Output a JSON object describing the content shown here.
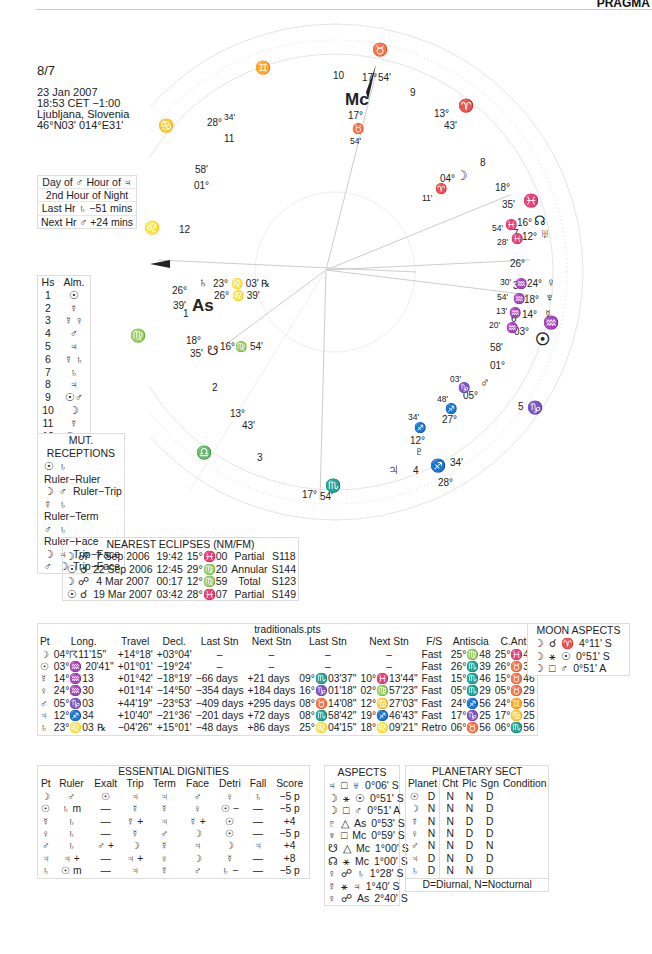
{
  "header": {
    "brand": "PRAGMA"
  },
  "chart": {
    "name": "8/7",
    "date": "23 Jan 2007",
    "time": "18:53  CET −1:00",
    "place": "Ljubljana, Slovenia",
    "coords": "46°N03' 014°E31'"
  },
  "planetary_hours": [
    "Day of ♂  Hour of ♃",
    "2nd Hour of Night",
    "Last Hr ♄  −51 mins",
    "Next Hr ♂  +24 mins"
  ],
  "almuten": {
    "headers": [
      "Hs",
      "Alm."
    ],
    "rows": [
      [
        "1",
        "☉"
      ],
      [
        "2",
        "☿"
      ],
      [
        "3",
        "☿ ♀"
      ],
      [
        "4",
        "♂"
      ],
      [
        "5",
        "♃"
      ],
      [
        "6",
        "☿ ♄"
      ],
      [
        "7",
        "♄"
      ],
      [
        "8",
        "♃"
      ],
      [
        "9",
        "☉♂"
      ],
      [
        "10",
        "☽"
      ],
      [
        "11",
        "☿"
      ],
      [
        "12",
        "☉♃"
      ]
    ]
  },
  "mutual_receptions": {
    "title": "MUT. RECEPTIONS",
    "rows": [
      [
        "☉",
        "♄",
        "Ruler−Ruler"
      ],
      [
        "☽",
        "♂",
        "Ruler−Trip"
      ],
      [
        "☿",
        "♄",
        "Ruler−Term"
      ],
      [
        "♂",
        "♄",
        "Ruler−Face"
      ],
      [
        "☽",
        "♃",
        "Trip−Face"
      ],
      [
        "♂",
        "☽",
        "Trip−Face"
      ]
    ]
  },
  "eclipses": {
    "title": "NEAREST ECLIPSES (NM/FM)",
    "rows": [
      [
        "☽ ☍",
        "7 Sep 2006",
        "19:42",
        "15°♓00",
        "Partial",
        "S118"
      ],
      [
        "☉ ☌",
        "22 Sep 2006",
        "12:45",
        "29°♍20",
        "Annular",
        "S144"
      ],
      [
        "☽ ☍",
        "4 Mar 2007",
        "00:17",
        "12°♍59",
        "Total",
        "S123"
      ],
      [
        "☉ ☌",
        "19 Mar 2007",
        "03:42",
        "28°♓07",
        "Partial",
        "S149"
      ]
    ]
  },
  "traditionals": {
    "title": "traditionals.pts",
    "headers": [
      "Pt",
      "Long.",
      "Travel",
      "Decl.",
      "Last Stn",
      "Next Stn",
      "Last Stn",
      "Next Stn",
      "F/S",
      "Antiscia",
      "C.Ant."
    ],
    "rows": [
      [
        "☽",
        "04°☈11'15\"",
        "+14°18'",
        "+03°04'",
        "–",
        "–",
        "–",
        "–",
        "Fast",
        "25°♍48",
        "25°♓48"
      ],
      [
        "☉",
        "03°♒ 20'41\"",
        "+01°01'",
        "−19°24'",
        "–",
        "–",
        "–",
        "–",
        "Fast",
        "26°♏39",
        "26°♉39"
      ],
      [
        "☿",
        "14°♒13",
        "+01°42'",
        "−18°19'",
        "−66 days",
        "+21 days",
        "09°♏03'37\"",
        "10°♓13'44\"",
        "Fast",
        "15°♏46",
        "15°♉46"
      ],
      [
        "♀",
        "24°♒30",
        "+01°14'",
        "−14°50'",
        "−354 days",
        "+184 days",
        "16°♑01'18\"",
        "02°♍57'23\"",
        "Fast",
        "05°♏29",
        "05°♉29"
      ],
      [
        "♂",
        "05°♑03",
        "+44'19\"",
        "−23°53'",
        "−409 days",
        "+295 days",
        "08°♉14'08\"",
        "12°♋27'03\"",
        "Fast",
        "24°♐56",
        "24°♊56"
      ],
      [
        "♃",
        "12°♐34",
        "+10'40\"",
        "−21°36'",
        "−201 days",
        "+72 days",
        "08°♏58'42\"",
        "19°♐46'43\"",
        "Fast",
        "17°♑25",
        "17°♋25"
      ],
      [
        "♄",
        "23°♌03 ℞",
        "−04'26\"",
        "+15°01'",
        "−48 days",
        "+86 days",
        "25°♌04'15\"",
        "18°♌09'21\"",
        "Retro",
        "06°♉56",
        "06°♏56"
      ]
    ]
  },
  "moon_aspects": {
    "title": "MOON ASPECTS",
    "rows": [
      [
        "☽",
        "☌",
        "♈",
        "4°11' S"
      ],
      [
        "☽",
        "⚹",
        "☉",
        "0°51' S"
      ],
      [
        "☽",
        "□",
        "♂",
        "0°51' A"
      ]
    ]
  },
  "dignities": {
    "title": "ESSENTIAL DIGNITIES",
    "headers": [
      "Pt",
      "Ruler",
      "Exalt",
      "Trip",
      "Term",
      "Face",
      "Detri",
      "Fall",
      "Score"
    ],
    "rows": [
      [
        "☽",
        "♂",
        "☉",
        "♃",
        "♃",
        "♂",
        "♀",
        "♄",
        "−5 p"
      ],
      [
        "☉",
        "♄ m",
        "—",
        "☿",
        "☿",
        "♀",
        "☉ −",
        "—",
        "−5 p"
      ],
      [
        "☿",
        "♄",
        "—",
        "☿ +",
        "♃",
        "☿ +",
        "☉",
        "—",
        "+4"
      ],
      [
        "♀",
        "♄",
        "—",
        "☿",
        "♂",
        "☽",
        "☉",
        "—",
        "−5 p"
      ],
      [
        "♂",
        "♄",
        "♂ +",
        "☽",
        "☿",
        "♃",
        "☽",
        "♃",
        "+4"
      ],
      [
        "♃",
        "♃ +",
        "—",
        "♃ +",
        "♀",
        "☽",
        "☿",
        "—",
        "+8"
      ],
      [
        "♄",
        "☉ m",
        "—",
        "♃",
        "☿",
        "♂",
        "♄ −",
        "—",
        "−5 p"
      ]
    ]
  },
  "aspects": {
    "title": "ASPECTS",
    "rows": [
      [
        "♃",
        "□",
        "♅",
        "0°06' S"
      ],
      [
        "☽",
        "⚹",
        "☉",
        "0°51' S"
      ],
      [
        "☽",
        "□",
        "♂",
        "0°51' A"
      ],
      [
        "♇",
        "△",
        "As",
        "0°53' S"
      ],
      [
        "♆",
        "□",
        "Mc",
        "0°59' S"
      ],
      [
        "☋",
        "△",
        "Mc",
        "1°00' S"
      ],
      [
        "☊",
        "⚹",
        "Mc",
        "1°00' S"
      ],
      [
        "♀",
        "☍",
        "♄",
        "1°28' S"
      ],
      [
        "☿",
        "⚹",
        "♃",
        "1°40' S"
      ],
      [
        "♀",
        "☍",
        "As",
        "2°40' S"
      ]
    ]
  },
  "sect": {
    "title": "PLANETARY SECT",
    "headers": [
      "Planet",
      "Cht",
      "Plc",
      "Sgn",
      "Condition"
    ],
    "rows": [
      [
        "☉",
        "D",
        "N",
        "N",
        "D",
        ""
      ],
      [
        "☽",
        "N",
        "N",
        "N",
        "D",
        ""
      ],
      [
        "☿",
        "N",
        "N",
        "D",
        "D",
        ""
      ],
      [
        "♀",
        "N",
        "N",
        "D",
        "D",
        ""
      ],
      [
        "♂",
        "N",
        "N",
        "D",
        "N",
        ""
      ],
      [
        "♃",
        "D",
        "N",
        "D",
        "D",
        ""
      ],
      [
        "♄",
        "D",
        "N",
        "N",
        "D",
        ""
      ]
    ],
    "legend": "D=Diurnal, N=Nocturnal"
  },
  "wheel": {
    "cusps": {
      "mc": {
        "label": "Mc",
        "deg": "17°",
        "sign": "♉",
        "min": "54'"
      },
      "asc": {
        "label": "As",
        "deg": "26°",
        "min": "39'"
      },
      "desc": {
        "deg": "26°",
        "min": "39'"
      },
      "ic": {
        "deg": "17°",
        "min": "54'"
      },
      "c11": {
        "deg": "28°",
        "min": "34'"
      },
      "c12": {
        "deg": "01°",
        "min": "58'"
      },
      "c2": {
        "deg": "18°",
        "min": "35'"
      },
      "c3": {
        "deg": "13°",
        "min": "43'"
      },
      "c8": {
        "deg": "13°",
        "min": "43'"
      },
      "c7": {
        "deg": "18°",
        "min": "35'"
      },
      "c5": {
        "deg": "28°",
        "min": "34'"
      },
      "c6": {
        "deg": "01°",
        "min": "58'"
      }
    },
    "house_numbers": [
      "1",
      "2",
      "3",
      "4",
      "5",
      "6",
      "7",
      "8",
      "9",
      "10",
      "11",
      "12"
    ],
    "signs": {
      "taurus": "♉",
      "gemini": "♊",
      "cancer": "♋",
      "leo": "♌",
      "virgo": "♍",
      "libra": "♎",
      "scorpio": "♏",
      "sagittarius": "♐",
      "capricorn": "♑",
      "aquarius": "♒",
      "pisces": "♓",
      "aries": "♈"
    },
    "planets": {
      "saturn": {
        "glyph": "♄",
        "text": "23° ♌ 03' ℞"
      },
      "asc_text": "26° ♌ 39'",
      "south_node": {
        "glyph": "☋",
        "text": "16°♍ 54'"
      },
      "moon": {
        "glyph": "☽",
        "deg": "04°",
        "sign": "♈",
        "min": "11'"
      },
      "north_node": {
        "glyph": "☊",
        "deg": "16°",
        "sign": "♓",
        "min": "54'"
      },
      "uranus": {
        "glyph": "♅",
        "deg": "12°",
        "sign": "♓",
        "min": "28'"
      },
      "venus": {
        "glyph": "♀",
        "deg": "24°",
        "sign": "♒",
        "min": "30'"
      },
      "neptune": {
        "glyph": "♆",
        "deg": "18°",
        "sign": "♒",
        "min": "54'"
      },
      "mercury": {
        "glyph": "☿",
        "deg": "14°",
        "sign": "♒",
        "min": "13'"
      },
      "sun": {
        "glyph": "☉",
        "deg": "03°",
        "sign": "♒",
        "min": "20'"
      },
      "mars": {
        "glyph": "♂",
        "deg": "05°",
        "sign": "♑",
        "min": "03'"
      },
      "pluto": {
        "glyph": "♇",
        "deg": "27°",
        "sign": "♐",
        "min": "48'"
      },
      "jupiter": {
        "glyph": "♃",
        "deg": "12°",
        "sign": "♐",
        "min": "34'"
      }
    }
  }
}
